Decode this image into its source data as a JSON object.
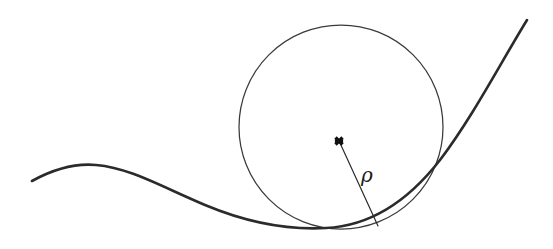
{
  "figure": {
    "background_color": "#ffffff",
    "width": 553,
    "height": 249
  },
  "curve": {
    "label": "curve",
    "color": "#2b2b2b",
    "stroke_width": 2.6,
    "path": "M 32 181 C 52 170, 74 163, 96 165 C 130 168, 160 186, 205 205 C 248 223, 290 230, 326 228 C 368 226, 405 205, 440 160 C 472 118, 500 64, 527 20",
    "left_end": [
      32,
      181
    ],
    "local_max": [
      96,
      165
    ],
    "minimum": [
      326,
      228
    ],
    "right_end": [
      527,
      20
    ]
  },
  "osculating_circle": {
    "label": "osculating circle",
    "color": "#3a3a3a",
    "stroke_width": 1.25,
    "center": [
      341,
      127
    ],
    "radius": 102,
    "bounds": {
      "left": 239,
      "right": 443,
      "top": 25,
      "bottom": 229
    }
  },
  "center_marker": {
    "label": "center of curvature",
    "glyph": "cross-mark",
    "color": "#111111",
    "position": [
      339,
      141
    ],
    "size": 7
  },
  "radius_line": {
    "label": "radius of curvature",
    "color": "#2b2b2b",
    "stroke_width": 1.2,
    "from": [
      340,
      143
    ],
    "to": [
      378,
      226
    ]
  },
  "annotations": {
    "rho": {
      "text": "ρ",
      "meaning": "radius of curvature",
      "position": [
        367,
        176
      ],
      "font_size": 20,
      "italic": true,
      "color": "#1a1a1a"
    }
  }
}
